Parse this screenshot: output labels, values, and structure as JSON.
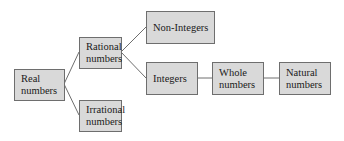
{
  "diagram": {
    "type": "tree",
    "nodes": [
      {
        "id": "real",
        "label": "Real\nnumbers"
      },
      {
        "id": "rational",
        "label": "Rational\nnumbers"
      },
      {
        "id": "irrational",
        "label": "Irrational\nnumbers"
      },
      {
        "id": "non_integers",
        "label": "Non-Integers"
      },
      {
        "id": "integers",
        "label": "Integers"
      },
      {
        "id": "whole",
        "label": "Whole\nnumbers"
      },
      {
        "id": "natural",
        "label": "Natural\nnumbers"
      }
    ],
    "edges": [
      [
        "real",
        "rational"
      ],
      [
        "real",
        "irrational"
      ],
      [
        "rational",
        "non_integers"
      ],
      [
        "rational",
        "integers"
      ],
      [
        "integers",
        "whole"
      ],
      [
        "whole",
        "natural"
      ]
    ],
    "colors": {
      "box_fill": "#d9d9d9",
      "box_border": "#6e6e6e",
      "line": "#6e6e6e"
    }
  }
}
